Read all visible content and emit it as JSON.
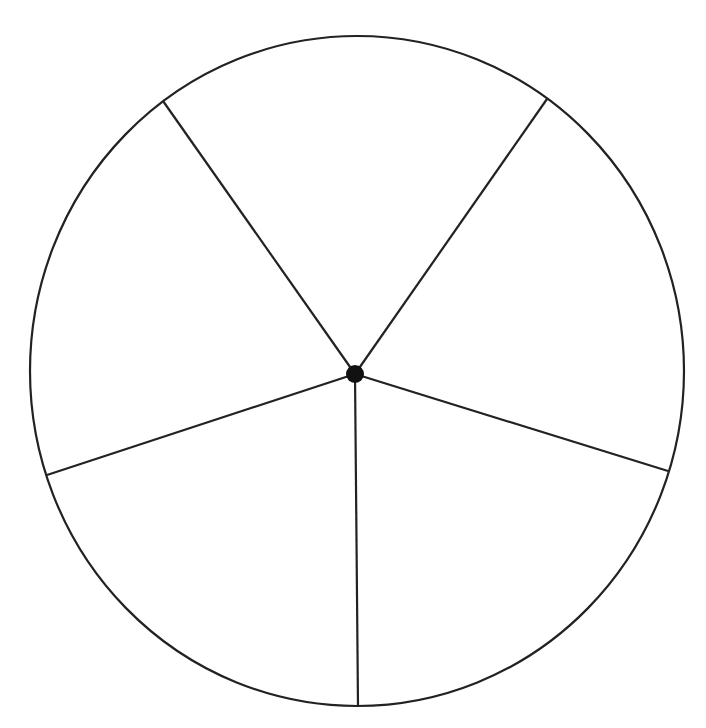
{
  "diagram": {
    "type": "circle-divided-into-sectors",
    "sector_count": 5,
    "stroke_color": "#222222",
    "background": "#ffffff",
    "circle": {
      "cx": 357,
      "cy": 371,
      "rx": 327,
      "ry": 335
    },
    "center_point": {
      "x": 355,
      "y": 374,
      "r": 9
    },
    "spokes": [
      {
        "x2": 163,
        "y2": 101
      },
      {
        "x2": 547,
        "y2": 99
      },
      {
        "x2": 668,
        "y2": 471
      },
      {
        "x2": 358,
        "y2": 706
      },
      {
        "x2": 47,
        "y2": 475
      }
    ]
  }
}
